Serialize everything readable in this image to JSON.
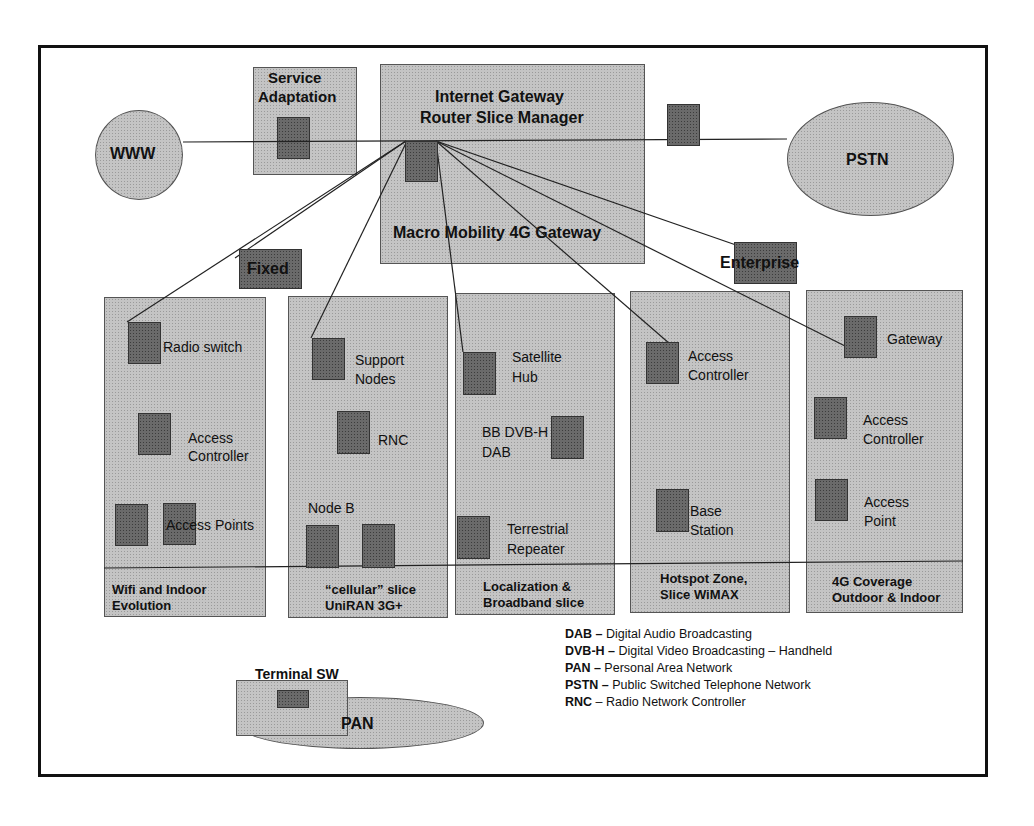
{
  "top": {
    "www": "WWW",
    "pstn": "PSTN",
    "service_adaptation": "Service\nAdaptation",
    "service_adaptation_l1": "Service",
    "service_adaptation_l2": "Adaptation",
    "gateway_l1": "Internet Gateway",
    "gateway_l2": "Router Slice Manager",
    "gateway_l3": "Macro Mobility 4G Gateway",
    "fixed": "Fixed",
    "enterprise": "Enterprise"
  },
  "columns": [
    {
      "caption_l1": "Wifi and Indoor",
      "caption_l2": "Evolution",
      "nodes": [
        "Radio switch",
        "Access",
        "Controller",
        "Access Points"
      ]
    },
    {
      "caption_l1": "“cellular” slice",
      "caption_l2": "UniRAN 3G+",
      "nodes": [
        "Support",
        "Nodes",
        "RNC",
        "Node B"
      ]
    },
    {
      "caption_l1": "Localization &",
      "caption_l2": "Broadband slice",
      "nodes": [
        "Satellite",
        "Hub",
        "BB DVB-H",
        "DAB",
        "Terrestrial",
        "Repeater"
      ]
    },
    {
      "caption_l1": "Hotspot Zone,",
      "caption_l2": "Slice WiMAX",
      "nodes": [
        "Access",
        "Controller",
        "Base",
        "Station"
      ]
    },
    {
      "caption_l1": "4G Coverage",
      "caption_l2": "Outdoor & Indoor",
      "nodes": [
        "Gateway",
        "Access",
        "Controller",
        "Access",
        "Point"
      ]
    }
  ],
  "terminal": {
    "label": "Terminal SW",
    "pan": "PAN"
  },
  "legend": [
    {
      "abbr": "DAB –",
      "text": " Digital Audio Broadcasting"
    },
    {
      "abbr": "DVB-H –",
      "text": " Digital Video Broadcasting – Handheld"
    },
    {
      "abbr": "PAN –",
      "text": " Personal Area Network"
    },
    {
      "abbr": "PSTN –",
      "text": " Public Switched Telephone Network"
    },
    {
      "abbr": "RNC",
      "text": " – Radio Network Controller"
    }
  ]
}
